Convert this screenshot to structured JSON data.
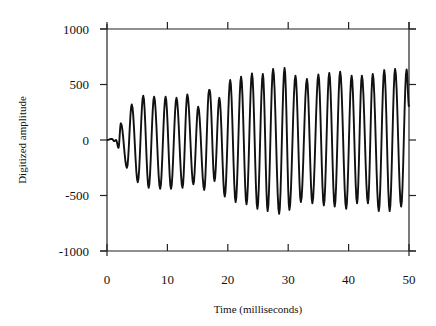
{
  "chart_data": {
    "type": "line",
    "title": "",
    "xlabel": "Time (milliseconds)",
    "ylabel": "Digitized amplitude",
    "xlim": [
      0,
      50
    ],
    "ylim": [
      -1000,
      1000
    ],
    "x_ticks": [
      0,
      10,
      20,
      30,
      40,
      50
    ],
    "x_tick_labels": [
      "0",
      "10",
      "20",
      "30",
      "40",
      "50"
    ],
    "y_ticks": [
      1000,
      500,
      0,
      -500,
      -1000
    ],
    "y_tick_labels": [
      "1000",
      "500",
      "0",
      "-500",
      "-1000"
    ],
    "grid": false,
    "legend": null,
    "series": [
      {
        "name": "waveform",
        "color": "#111111",
        "description": "Oscillating signal (~550 Hz) growing in amplitude, extrema listed as [time_ms, amplitude]",
        "points": [
          [
            0.0,
            0
          ],
          [
            0.8,
            10
          ],
          [
            1.2,
            -10
          ],
          [
            1.5,
            0
          ],
          [
            1.9,
            -70
          ],
          [
            2.3,
            150
          ],
          [
            3.3,
            -250
          ],
          [
            4.1,
            320
          ],
          [
            5.1,
            -380
          ],
          [
            6.0,
            400
          ],
          [
            6.9,
            -430
          ],
          [
            7.8,
            390
          ],
          [
            8.8,
            -440
          ],
          [
            9.7,
            390
          ],
          [
            10.6,
            -440
          ],
          [
            11.5,
            380
          ],
          [
            12.5,
            -430
          ],
          [
            13.3,
            410
          ],
          [
            14.3,
            -400
          ],
          [
            15.1,
            300
          ],
          [
            16.1,
            -450
          ],
          [
            17.0,
            450
          ],
          [
            16.9,
            450
          ],
          [
            17.8,
            -370
          ],
          [
            18.6,
            380
          ],
          [
            19.5,
            -510
          ],
          [
            20.4,
            540
          ],
          [
            21.3,
            -560
          ],
          [
            22.2,
            570
          ],
          [
            23.1,
            -580
          ],
          [
            24.0,
            600
          ],
          [
            24.9,
            -620
          ],
          [
            25.8,
            595
          ],
          [
            26.6,
            -640
          ],
          [
            27.5,
            640
          ],
          [
            28.5,
            -665
          ],
          [
            29.4,
            650
          ],
          [
            30.2,
            -630
          ],
          [
            31.2,
            580
          ],
          [
            32.1,
            -560
          ],
          [
            33.1,
            550
          ],
          [
            34.0,
            -570
          ],
          [
            35.0,
            590
          ],
          [
            35.9,
            -590
          ],
          [
            36.8,
            605
          ],
          [
            37.7,
            -600
          ],
          [
            38.6,
            615
          ],
          [
            39.6,
            -620
          ],
          [
            40.5,
            580
          ],
          [
            41.4,
            -570
          ],
          [
            42.2,
            580
          ],
          [
            43.2,
            -570
          ],
          [
            44.0,
            595
          ],
          [
            45.0,
            -640
          ],
          [
            45.9,
            630
          ],
          [
            46.8,
            -640
          ],
          [
            47.7,
            640
          ],
          [
            48.7,
            -600
          ],
          [
            49.6,
            635
          ],
          [
            50.0,
            300
          ]
        ]
      }
    ]
  }
}
